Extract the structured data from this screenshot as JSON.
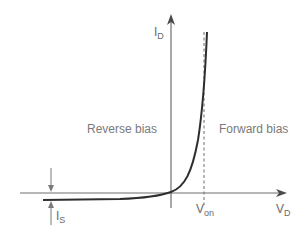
{
  "diagram": {
    "axes": {
      "x": {
        "label_main": "V",
        "label_sub": "D"
      },
      "y": {
        "label_main": "I",
        "label_sub": "D"
      }
    },
    "regions": {
      "reverse": "Reverse bias",
      "forward": "Forward bias"
    },
    "markers": {
      "von": {
        "label_main": "V",
        "label_sub": "on"
      },
      "is": {
        "label_main": "I",
        "label_sub": "S"
      }
    },
    "colors": {
      "axis": "#6e6e6e",
      "curve": "#2e2e2e",
      "text": "#6a6a6a",
      "background": "#ffffff"
    }
  }
}
